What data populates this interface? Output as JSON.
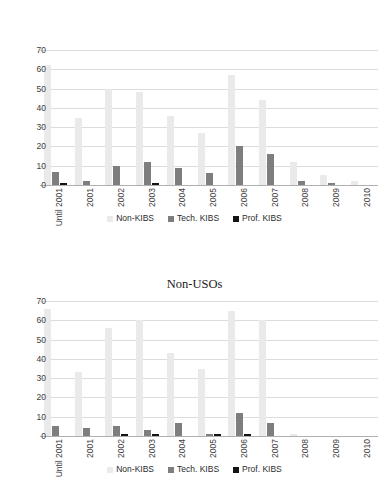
{
  "charts": [
    {
      "title": "",
      "legend": [
        {
          "label": "Non-KIBS",
          "color": "#eaeaea",
          "key": "nonkibs"
        },
        {
          "label": "Tech. KIBS",
          "color": "#7e7e7e",
          "key": "tech"
        },
        {
          "label": "Prof. KIBS",
          "color": "#141414",
          "key": "prof"
        }
      ],
      "yticks": [
        "70",
        "60",
        "50",
        "40",
        "30",
        "20",
        "10",
        "0"
      ],
      "xlabels": [
        "Until 2001",
        "2001",
        "2002",
        "2003",
        "2004",
        "2005",
        "2006",
        "2007",
        "2008",
        "2009",
        "2010"
      ]
    },
    {
      "title": "Non-USOs",
      "legend": [
        {
          "label": "Non-KIBS",
          "color": "#eaeaea",
          "key": "nonkibs"
        },
        {
          "label": "Tech. KIBS",
          "color": "#7e7e7e",
          "key": "tech"
        },
        {
          "label": "Prof. KIBS",
          "color": "#141414",
          "key": "prof"
        }
      ],
      "yticks": [
        "70",
        "60",
        "50",
        "40",
        "30",
        "20",
        "10",
        "0"
      ],
      "xlabels": [
        "Until 2001",
        "2001",
        "2002",
        "2003",
        "2004",
        "2005",
        "2006",
        "2007",
        "2008",
        "2009",
        "2010"
      ]
    }
  ],
  "chart_data": [
    {
      "type": "bar",
      "title": "",
      "xlabel": "",
      "ylabel": "",
      "ylim": [
        0,
        70
      ],
      "ytick_step": 10,
      "grid": true,
      "legend_position": "bottom",
      "categories": [
        "Until 2001",
        "2001",
        "2002",
        "2003",
        "2004",
        "2005",
        "2006",
        "2007",
        "2008",
        "2009",
        "2010"
      ],
      "series": [
        {
          "name": "Non-KIBS",
          "color": "#eaeaea",
          "values": [
            62,
            35,
            50,
            48,
            36,
            27,
            57,
            44,
            12,
            5,
            2
          ]
        },
        {
          "name": "Tech. KIBS",
          "color": "#7e7e7e",
          "values": [
            7,
            2,
            10,
            12,
            9,
            6,
            20,
            16,
            2,
            1,
            0
          ]
        },
        {
          "name": "Prof. KIBS",
          "color": "#141414",
          "values": [
            1,
            0,
            0,
            1,
            0,
            0,
            0,
            0,
            0,
            0,
            0
          ]
        }
      ]
    },
    {
      "type": "bar",
      "title": "Non-USOs",
      "xlabel": "",
      "ylabel": "",
      "ylim": [
        0,
        70
      ],
      "ytick_step": 10,
      "grid": true,
      "legend_position": "bottom",
      "categories": [
        "Until 2001",
        "2001",
        "2002",
        "2003",
        "2004",
        "2005",
        "2006",
        "2007",
        "2008",
        "2009",
        "2010"
      ],
      "series": [
        {
          "name": "Non-KIBS",
          "color": "#eaeaea",
          "values": [
            66,
            33,
            56,
            60,
            43,
            35,
            65,
            60,
            1,
            0,
            0
          ]
        },
        {
          "name": "Tech. KIBS",
          "color": "#7e7e7e",
          "values": [
            5,
            4,
            5,
            3,
            7,
            1,
            12,
            7,
            0,
            0,
            0
          ]
        },
        {
          "name": "Prof. KIBS",
          "color": "#141414",
          "values": [
            0,
            0,
            1,
            1,
            0,
            1,
            1,
            0,
            0,
            0,
            0
          ]
        }
      ]
    }
  ]
}
